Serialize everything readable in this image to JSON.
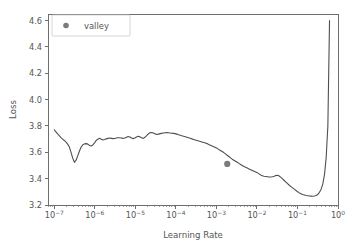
{
  "figure": {
    "background_color": "#ffffff",
    "line_color": "#4f4f4f",
    "marker_color": "#7b7b7b",
    "text_color": "#555555",
    "spine_color": "#6e6e6e"
  },
  "chart_data": {
    "type": "line",
    "title": "",
    "xlabel": "Learning Rate",
    "ylabel": "Loss",
    "xscale": "log",
    "yscale": "linear",
    "xlim": [
      7e-08,
      1.0
    ],
    "ylim": [
      3.2,
      4.65
    ],
    "grid": false,
    "legend": {
      "position": "upper left",
      "entries": [
        {
          "label": "valley",
          "marker": "circle",
          "color": "#7b7b7b"
        }
      ]
    },
    "xticks": [
      1e-07,
      1e-06,
      1e-05,
      0.0001,
      0.001,
      0.01,
      0.1,
      1
    ],
    "xtick_labels": [
      "10-7",
      "10-6",
      "10-5",
      "10-4",
      "10-3",
      "10-2",
      "10-1",
      "100"
    ],
    "xtick_mantissa": [
      "10",
      "10",
      "10",
      "10",
      "10",
      "10",
      "10",
      "10"
    ],
    "xtick_exponent": [
      "−7",
      "−6",
      "−5",
      "−4",
      "−3",
      "−2",
      "−1",
      "0"
    ],
    "yticks": [
      3.2,
      3.4,
      3.6,
      3.8,
      4.0,
      4.2,
      4.4,
      4.6
    ],
    "ytick_labels": [
      "3.2",
      "3.4",
      "3.6",
      "3.8",
      "4.0",
      "4.2",
      "4.4",
      "4.6"
    ],
    "series": [
      {
        "name": "loss",
        "color": "#4f4f4f",
        "x": [
          1e-07,
          1.1e-07,
          1.21e-07,
          1.33e-07,
          1.46e-07,
          1.61e-07,
          1.77e-07,
          1.95e-07,
          2.14e-07,
          2.36e-07,
          2.59e-07,
          2.85e-07,
          3.14e-07,
          3.45e-07,
          3.8e-07,
          4.18e-07,
          4.6e-07,
          5.06e-07,
          5.56e-07,
          6.12e-07,
          6.73e-07,
          7.4e-07,
          8.14e-07,
          8.96e-07,
          9.85e-07,
          1.08e-06,
          1.19e-06,
          1.31e-06,
          1.44e-06,
          1.59e-06,
          1.75e-06,
          1.92e-06,
          2.12e-06,
          2.33e-06,
          2.56e-06,
          2.82e-06,
          3.1e-06,
          3.41e-06,
          3.75e-06,
          4.13e-06,
          4.54e-06,
          4.99e-06,
          5.49e-06,
          6.04e-06,
          6.65e-06,
          7.31e-06,
          8.04e-06,
          8.85e-06,
          9.73e-06,
          1.07e-05,
          1.18e-05,
          1.29e-05,
          1.42e-05,
          1.57e-05,
          1.72e-05,
          1.9e-05,
          2.09e-05,
          2.3e-05,
          2.53e-05,
          2.78e-05,
          3.06e-05,
          3.36e-05,
          3.7e-05,
          4.07e-05,
          4.48e-05,
          4.92e-05,
          5.42e-05,
          5.96e-05,
          6.55e-05,
          7.21e-05,
          7.93e-05,
          8.72e-05,
          9.59e-05,
          0.000106,
          0.000116,
          0.000128,
          0.00014,
          0.000155,
          0.00017,
          0.000187,
          0.000206,
          0.000226,
          0.000249,
          0.000274,
          0.000301,
          0.000331,
          0.000365,
          0.000401,
          0.000441,
          0.000485,
          0.000534,
          0.000587,
          0.000646,
          0.000711,
          0.000782,
          0.00086,
          0.000946,
          0.00104,
          0.00114,
          0.00126,
          0.00139,
          0.00152,
          0.00168,
          0.00184,
          0.00203,
          0.00223,
          0.00245,
          0.0027,
          0.00297,
          0.00327,
          0.00359,
          0.00395,
          0.00435,
          0.00478,
          0.00526,
          0.00579,
          0.00637,
          0.007,
          0.0077,
          0.00847,
          0.00932,
          0.0103,
          0.0113,
          0.0124,
          0.0136,
          0.015,
          0.0165,
          0.0182,
          0.02,
          0.022,
          0.0242,
          0.0266,
          0.0293,
          0.0322,
          0.0354,
          0.039,
          0.0429,
          0.0472,
          0.0519,
          0.0571,
          0.0628,
          0.0691,
          0.076,
          0.0836,
          0.0919,
          0.101,
          0.111,
          0.122,
          0.134,
          0.148,
          0.163,
          0.179,
          0.197,
          0.217,
          0.238,
          0.262,
          0.288,
          0.317,
          0.349,
          0.384,
          0.422,
          0.464,
          0.511,
          0.562,
          0.618
        ],
        "y": [
          3.77,
          3.755,
          3.74,
          3.726,
          3.712,
          3.7,
          3.69,
          3.678,
          3.662,
          3.64,
          3.6,
          3.556,
          3.524,
          3.54,
          3.575,
          3.61,
          3.64,
          3.657,
          3.664,
          3.666,
          3.662,
          3.652,
          3.648,
          3.656,
          3.672,
          3.69,
          3.7,
          3.706,
          3.7,
          3.694,
          3.697,
          3.702,
          3.706,
          3.708,
          3.706,
          3.704,
          3.705,
          3.708,
          3.71,
          3.711,
          3.709,
          3.706,
          3.708,
          3.714,
          3.72,
          3.716,
          3.708,
          3.704,
          3.708,
          3.716,
          3.722,
          3.718,
          3.71,
          3.706,
          3.714,
          3.726,
          3.74,
          3.748,
          3.75,
          3.746,
          3.74,
          3.736,
          3.738,
          3.742,
          3.744,
          3.746,
          3.748,
          3.75,
          3.749,
          3.747,
          3.745,
          3.744,
          3.742,
          3.738,
          3.734,
          3.73,
          3.726,
          3.722,
          3.718,
          3.714,
          3.71,
          3.706,
          3.702,
          3.698,
          3.694,
          3.69,
          3.686,
          3.682,
          3.678,
          3.674,
          3.67,
          3.666,
          3.66,
          3.654,
          3.648,
          3.642,
          3.636,
          3.63,
          3.622,
          3.614,
          3.606,
          3.598,
          3.588,
          3.578,
          3.568,
          3.558,
          3.548,
          3.54,
          3.532,
          3.524,
          3.516,
          3.508,
          3.5,
          3.492,
          3.486,
          3.48,
          3.474,
          3.468,
          3.462,
          3.456,
          3.45,
          3.444,
          3.436,
          3.428,
          3.422,
          3.418,
          3.416,
          3.414,
          3.412,
          3.412,
          3.414,
          3.418,
          3.424,
          3.426,
          3.42,
          3.41,
          3.398,
          3.386,
          3.374,
          3.362,
          3.35,
          3.34,
          3.33,
          3.32,
          3.31,
          3.3,
          3.292,
          3.286,
          3.28,
          3.276,
          3.272,
          3.27,
          3.268,
          3.267,
          3.266,
          3.268,
          3.272,
          3.28,
          3.296,
          3.32,
          3.36,
          3.43,
          3.56,
          3.8,
          4.6
        ]
      }
    ],
    "markers": [
      {
        "name": "valley",
        "x": 0.00185,
        "y": 3.512,
        "color": "#7b7b7b",
        "size": 5
      }
    ]
  }
}
